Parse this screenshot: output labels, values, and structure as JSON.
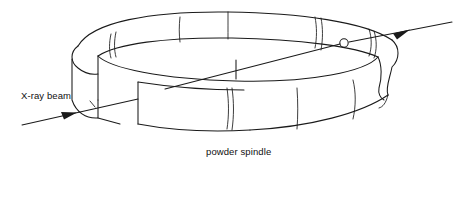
{
  "figure": {
    "width": 465,
    "height": 197,
    "background_color": "#ffffff",
    "ink_color": "#1a1a1a"
  },
  "labels": {
    "xray_beam": "X-ray beam",
    "powder_spindle": "powder spindle"
  },
  "parts": {
    "film_band_name": "cylindrical film band",
    "band_gap_name": "film band gap",
    "left_end_cap_name": "left rounded end cap",
    "right_end_cap_name": "right rounded end cap",
    "exit_port_name": "beam exit port",
    "spindle_name": "powder spindle tick",
    "beam_entry_arrow_name": "incident beam arrow",
    "beam_exit_arrow_name": "transmitted beam arrow"
  },
  "geometry": {
    "beam_entry_start": [
      22,
      125
    ],
    "beam_entry_arrow_tip": [
      76,
      113
    ],
    "beam_exit_arrow_tip": [
      409,
      30
    ],
    "beam_exit_end": [
      452,
      22
    ],
    "spindle_center": [
      236,
      68
    ],
    "exit_port_center": [
      344,
      43
    ],
    "exit_port_radius": 4.2,
    "back_band_divider_x": [
      180,
      228,
      316,
      322
    ],
    "front_band_divider_x": [
      227,
      232,
      297,
      353
    ],
    "left_seam_x": [
      110,
      115
    ]
  }
}
